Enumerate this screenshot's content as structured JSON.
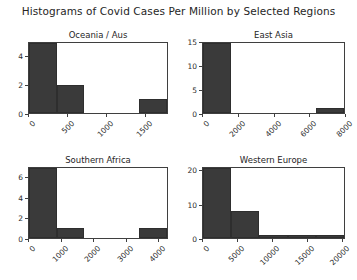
{
  "figure": {
    "title": "Histograms of Covid Cases Per Million by Selected Regions",
    "background": "#ffffff",
    "bar_color": "#3a3a3a",
    "axis_color": "#3f3f3f"
  },
  "chart_data": [
    {
      "type": "bar",
      "title": "Oceania / Aus",
      "xlabel": "",
      "ylabel": "",
      "grid": false,
      "legend": "none",
      "xlim": [
        0,
        1800
      ],
      "ylim": [
        0,
        5
      ],
      "xticks": [
        "0",
        "500",
        "1000",
        "1500"
      ],
      "xtick_values": [
        0,
        500,
        1000,
        1500
      ],
      "yticks": [
        "0",
        "2",
        "4"
      ],
      "ytick_values": [
        0,
        2,
        4
      ],
      "bin_edges": [
        0,
        360,
        720,
        1080,
        1440,
        1800
      ],
      "categories": [
        "0-360",
        "360-720",
        "720-1080",
        "1080-1440",
        "1440-1800"
      ],
      "values": [
        5,
        2,
        0,
        0,
        1
      ]
    },
    {
      "type": "bar",
      "title": "East Asia",
      "xlabel": "",
      "ylabel": "",
      "grid": false,
      "legend": "none",
      "xlim": [
        0,
        8000
      ],
      "ylim": [
        0,
        15
      ],
      "xticks": [
        "0",
        "2000",
        "4000",
        "6000",
        "8000"
      ],
      "xtick_values": [
        0,
        2000,
        4000,
        6000,
        8000
      ],
      "yticks": [
        "0",
        "5",
        "10",
        "15"
      ],
      "ytick_values": [
        0,
        5,
        10,
        15
      ],
      "bin_edges": [
        0,
        1600,
        3200,
        4800,
        6400,
        8000
      ],
      "categories": [
        "0-1600",
        "1600-3200",
        "3200-4800",
        "4800-6400",
        "6400-8000"
      ],
      "values": [
        15,
        0,
        0,
        0,
        1
      ]
    },
    {
      "type": "bar",
      "title": "Southern Africa",
      "xlabel": "",
      "ylabel": "",
      "grid": false,
      "legend": "none",
      "xlim": [
        0,
        4300
      ],
      "ylim": [
        0,
        7
      ],
      "xticks": [
        "0",
        "1000",
        "2000",
        "3000",
        "4000"
      ],
      "xtick_values": [
        0,
        1000,
        2000,
        3000,
        4000
      ],
      "yticks": [
        "0",
        "2",
        "4",
        "6"
      ],
      "ytick_values": [
        0,
        2,
        4,
        6
      ],
      "bin_edges": [
        0,
        860,
        1720,
        2580,
        3440,
        4300
      ],
      "categories": [
        "0-860",
        "860-1720",
        "1720-2580",
        "2580-3440",
        "3440-4300"
      ],
      "values": [
        7,
        1,
        0,
        0,
        1
      ]
    },
    {
      "type": "bar",
      "title": "Western Europe",
      "xlabel": "",
      "ylabel": "",
      "grid": false,
      "legend": "none",
      "xlim": [
        0,
        20500
      ],
      "ylim": [
        0,
        21
      ],
      "xticks": [
        "0",
        "5000",
        "10000",
        "15000",
        "20000"
      ],
      "xtick_values": [
        0,
        5000,
        10000,
        15000,
        20000
      ],
      "yticks": [
        "0",
        "10",
        "20"
      ],
      "ytick_values": [
        0,
        10,
        20
      ],
      "bin_edges": [
        0,
        4100,
        8200,
        12300,
        16400,
        20500
      ],
      "categories": [
        "0-4100",
        "4100-8200",
        "8200-12300",
        "12300-16400",
        "16400-20500"
      ],
      "values": [
        21,
        8,
        1,
        1,
        1
      ]
    }
  ]
}
